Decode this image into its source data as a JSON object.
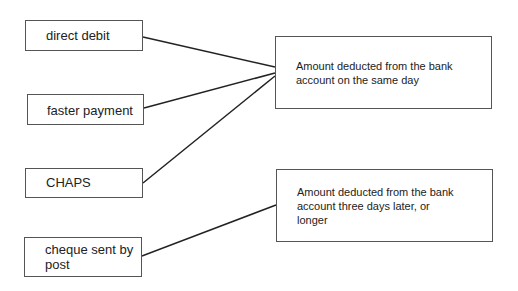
{
  "diagram": {
    "type": "matching",
    "left_items": [
      {
        "id": "direct-debit",
        "label": "direct debit"
      },
      {
        "id": "faster-payment",
        "label": "faster payment"
      },
      {
        "id": "chaps",
        "label": "CHAPS"
      },
      {
        "id": "cheque",
        "label": "cheque sent by\npost"
      }
    ],
    "right_items": [
      {
        "id": "same-day",
        "label": "Amount deducted from the bank\naccount on the same day"
      },
      {
        "id": "three-days",
        "label": "Amount deducted from the bank\naccount three days later, or\nlonger"
      }
    ],
    "connections": [
      {
        "from": "direct-debit",
        "to": "same-day"
      },
      {
        "from": "faster-payment",
        "to": "same-day"
      },
      {
        "from": "chaps",
        "to": "same-day"
      },
      {
        "from": "cheque",
        "to": "three-days"
      }
    ],
    "line_color": "#222222",
    "border_color": "#555555"
  }
}
